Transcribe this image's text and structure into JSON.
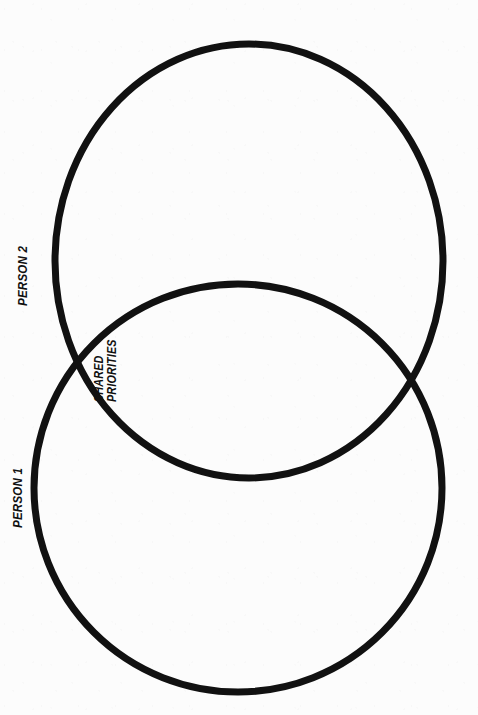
{
  "page": {
    "type": "venn-diagram-worksheet",
    "orientation": "landscape-rotated",
    "background_color": "#fcfcfc",
    "stroke_color": "#111111"
  },
  "diagram": {
    "title": "",
    "kind": "two-circle-venn",
    "stroke_width_px": 7,
    "circles": [
      {
        "id": "person-2-circle",
        "label": "PERSON 2",
        "cx": 249,
        "cy": 261,
        "rx": 194,
        "ry": 217
      },
      {
        "id": "person-1-circle",
        "label": "PERSON 1",
        "cx": 238,
        "cy": 488,
        "rx": 204,
        "ry": 204
      }
    ],
    "intersection": {
      "label_line_1": "SHARED",
      "label_line_2": "PRIORITIES",
      "crossing_points": [
        {
          "x": 63,
          "y": 367
        },
        {
          "x": 416,
          "y": 364
        }
      ]
    }
  },
  "labels": {
    "person_2": "PERSON 2",
    "person_1": "PERSON 1",
    "shared_line_1": "SHARED",
    "shared_line_2": "PRIORITIES"
  }
}
